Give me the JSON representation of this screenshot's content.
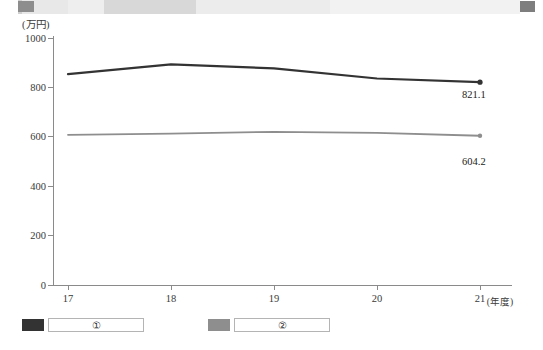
{
  "chart_data": {
    "type": "line",
    "title": "",
    "unit_label": "(万円)",
    "xlabel": "(年度)",
    "ylabel": "",
    "categories": [
      "17",
      "18",
      "19",
      "20",
      "21"
    ],
    "x": [
      17,
      18,
      19,
      20,
      21
    ],
    "ylim": [
      0,
      1000
    ],
    "yticks": [
      0,
      200,
      400,
      600,
      800,
      1000
    ],
    "grid": false,
    "legend_position": "bottom",
    "series": [
      {
        "name": "①",
        "color": "#333333",
        "values": [
          854,
          893,
          877,
          836,
          821.1
        ],
        "end_label": "821.1"
      },
      {
        "name": "②",
        "color": "#8e8e8e",
        "values": [
          608,
          613,
          620,
          616,
          604.2
        ],
        "end_label": "604.2"
      }
    ]
  },
  "axis": {
    "unit": "(万円)",
    "x_unit": "(年度)",
    "y_ticks": [
      "1000",
      "800",
      "600",
      "400",
      "200",
      "0"
    ],
    "x_ticks": [
      "17",
      "18",
      "19",
      "20",
      "21"
    ]
  },
  "legend": {
    "items": [
      {
        "marker": "series-1-swatch",
        "label": "①",
        "color": "#333333"
      },
      {
        "marker": "series-2-swatch",
        "label": "②",
        "color": "#8e8e8e"
      }
    ]
  },
  "annotations": {
    "series1_end_value": "821.1",
    "series2_end_value": "604.2"
  },
  "colors": {
    "series1": "#333333",
    "series2": "#8e8e8e",
    "axis": "#8a8a8a",
    "text": "#2b2b2b"
  }
}
